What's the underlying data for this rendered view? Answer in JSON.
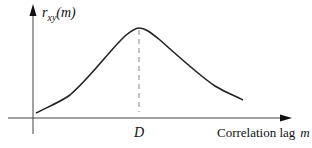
{
  "diagram": {
    "y_axis_label": "r",
    "y_axis_subscript": "xy",
    "y_axis_arg": "(m)",
    "peak_label": "D",
    "x_axis_label": "Correlation lag",
    "x_axis_var": "m",
    "curve_description": "cross-correlation function peaking at lag D",
    "colors": {
      "line": "#222222",
      "dash": "#777777",
      "background": "#ffffff"
    }
  }
}
